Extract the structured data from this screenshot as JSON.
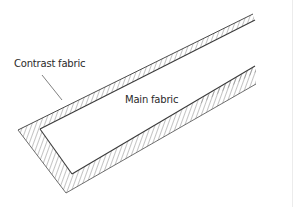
{
  "figure": {
    "type": "technical illustration",
    "labels": {
      "contrast": "Contrast fabric",
      "main": "Main fabric"
    },
    "colors": {
      "stroke": "#4a4a4a",
      "hatch": "#6a6a6a",
      "fill_main": "#ffffff",
      "background": "#ffffff"
    }
  }
}
